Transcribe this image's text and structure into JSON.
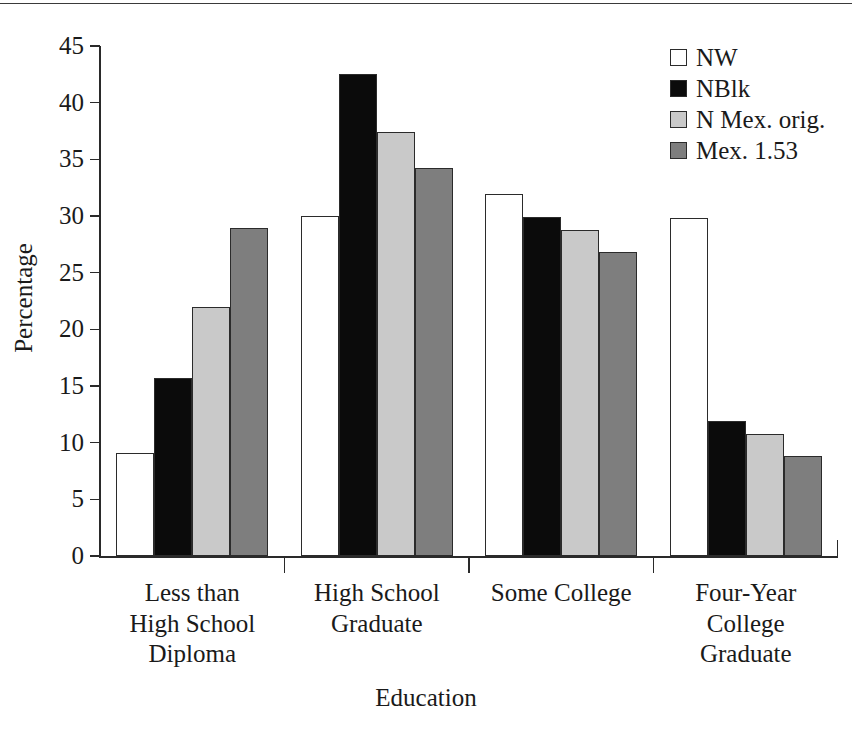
{
  "chart_data": {
    "type": "bar",
    "title": "",
    "xlabel": "Education",
    "ylabel": "Percentage",
    "ylim": [
      0,
      45
    ],
    "ytick_values": [
      0,
      5,
      10,
      15,
      20,
      25,
      30,
      35,
      40,
      45
    ],
    "ytick_labels": [
      "0",
      "5",
      "10",
      "15",
      "20",
      "25",
      "30",
      "35",
      "40",
      "45"
    ],
    "grid": false,
    "legend_position": "top-right",
    "categories": [
      "Less than\nHigh School\nDiploma",
      "High School\nGraduate",
      "Some College",
      "Four-Year\nCollege\nGraduate"
    ],
    "category_lines": [
      [
        "Less than",
        "High School",
        "Diploma"
      ],
      [
        "High School",
        "Graduate"
      ],
      [
        "Some College"
      ],
      [
        "Four-Year",
        "College",
        "Graduate"
      ]
    ],
    "series": [
      {
        "name": "NW",
        "color": "#ffffff",
        "values": [
          9.1,
          30.0,
          31.9,
          29.8
        ]
      },
      {
        "name": "NBlk",
        "color": "#0b0b0b",
        "values": [
          15.7,
          42.5,
          29.9,
          11.9
        ]
      },
      {
        "name": "N Mex. orig.",
        "color": "#c9c9c9",
        "values": [
          22.0,
          37.4,
          28.8,
          10.8
        ]
      },
      {
        "name": "Mex. 1.53",
        "color": "#7e7e7e",
        "values": [
          28.9,
          34.2,
          26.8,
          8.8
        ]
      }
    ]
  },
  "legend": {
    "items": [
      {
        "label": "NW",
        "swatch": "white-square-swatch"
      },
      {
        "label": "NBlk",
        "swatch": "black-square-swatch"
      },
      {
        "label": "N Mex. orig.",
        "swatch": "light-gray-square-swatch"
      },
      {
        "label": "Mex. 1.53",
        "swatch": "medium-gray-square-swatch"
      }
    ]
  },
  "axes": {
    "x_title": "Education",
    "y_title": "Percentage"
  }
}
